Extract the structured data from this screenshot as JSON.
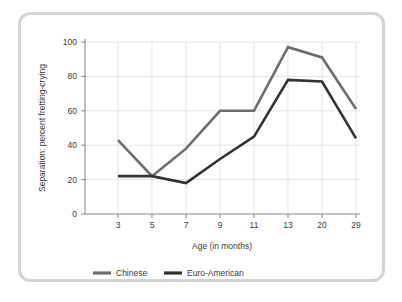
{
  "chart_data": {
    "type": "line",
    "title": "",
    "xlabel": "Age (in months)",
    "ylabel": "Separation: percent fretting-crying",
    "categories": [
      "3",
      "5",
      "7",
      "9",
      "11",
      "13",
      "20",
      "29"
    ],
    "x_tick_labels": [
      "3",
      "5",
      "7",
      "9",
      "11",
      "13",
      "20",
      "29"
    ],
    "y_tick_labels": [
      "0",
      "20",
      "40",
      "60",
      "80",
      "100"
    ],
    "y_ticks": [
      0,
      20,
      40,
      60,
      80,
      100
    ],
    "ylim": [
      0,
      100
    ],
    "grid": "both",
    "legend_position": "bottom",
    "series": [
      {
        "name": "Chinese",
        "color": "#6e6e6e",
        "values": [
          43,
          22,
          38,
          60,
          60,
          97,
          91,
          61
        ]
      },
      {
        "name": "Euro-American",
        "color": "#333333",
        "values": [
          22,
          22,
          18,
          32,
          45,
          78,
          77,
          44
        ]
      }
    ]
  },
  "legend": {
    "items": [
      {
        "label": "Chinese"
      },
      {
        "label": "Euro-American"
      }
    ]
  },
  "colors": {
    "chinese": "#6e6e6e",
    "euro_american": "#333333",
    "frame": "#d4d4d4",
    "grid": "#d9d9d9",
    "axis": "#8a8a8a",
    "text": "#3a3a3a"
  }
}
